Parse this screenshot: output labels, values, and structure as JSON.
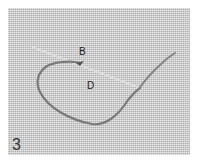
{
  "figure": {
    "step_number": "3",
    "labels": [
      {
        "id": "B",
        "text": "B"
      },
      {
        "id": "D",
        "text": "D"
      }
    ],
    "colors": {
      "fabric": "#c9c9c9",
      "thread": "#7a7a7a",
      "needle": "#eeeeee",
      "label": "#222222"
    }
  }
}
